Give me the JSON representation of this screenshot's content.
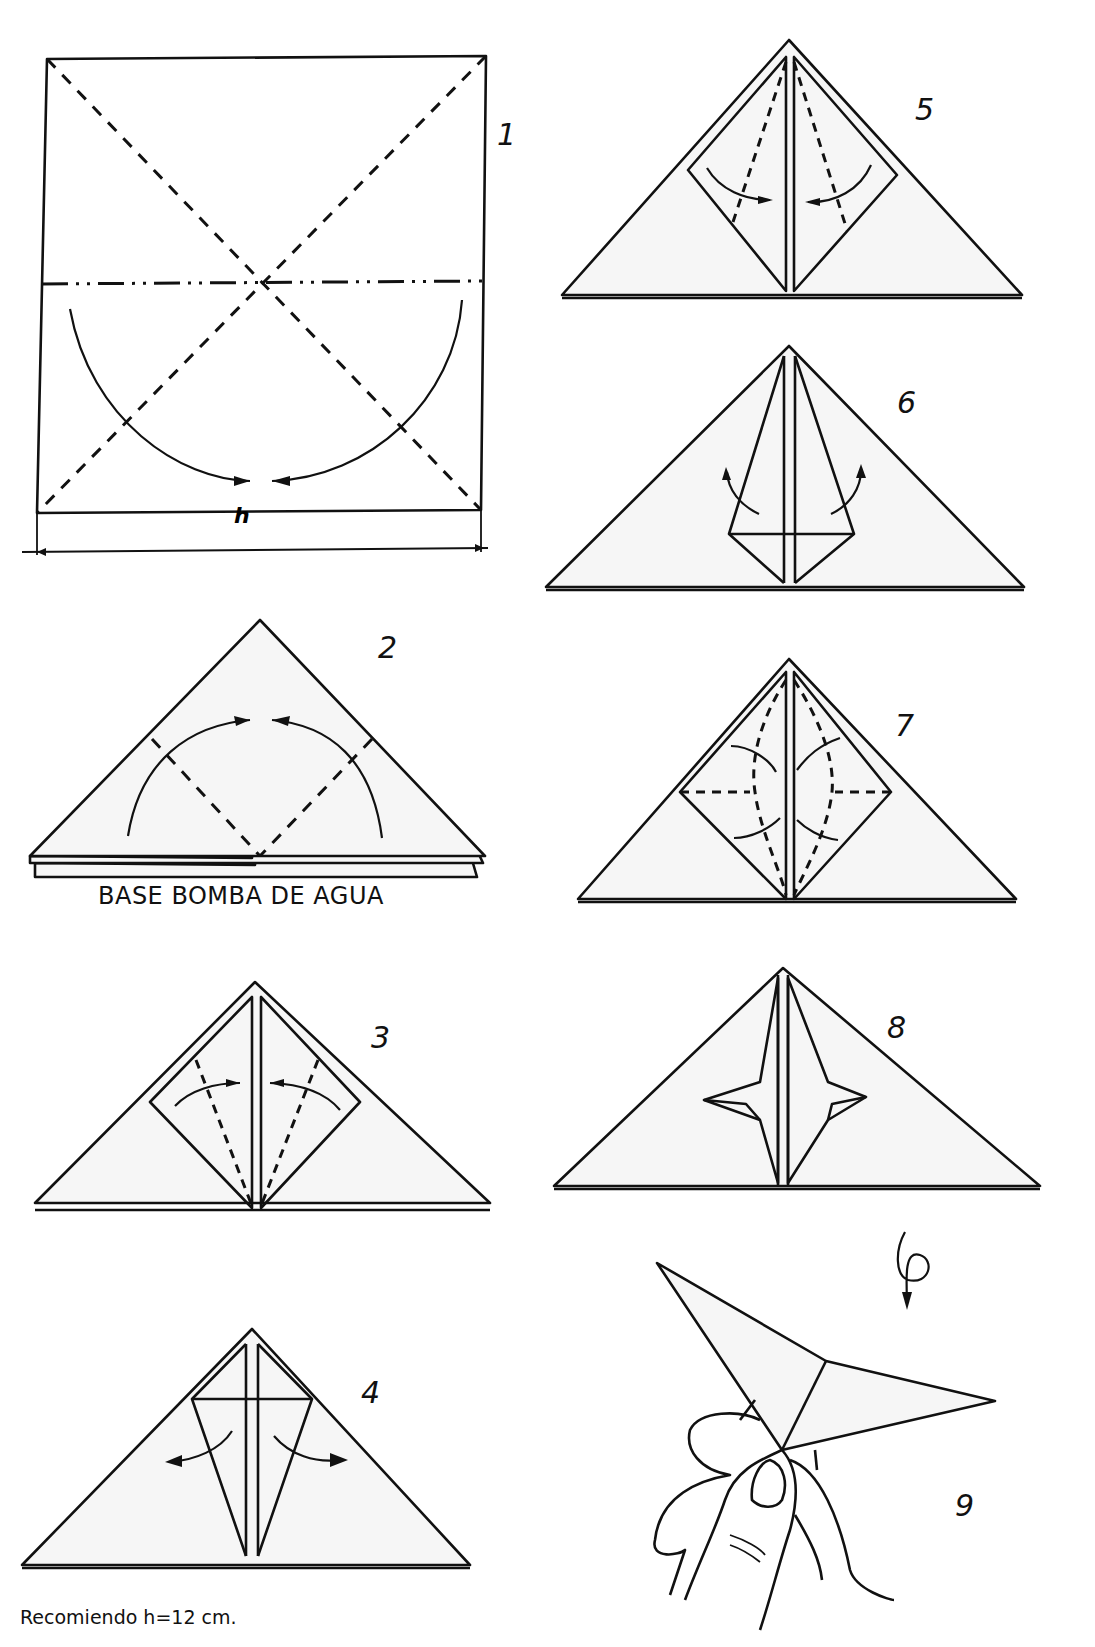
{
  "document": {
    "type": "origami-instructions",
    "base_name": "BASE BOMBA DE AGUA",
    "recommendation": "Recomiendo h=12 cm.",
    "dimension_label": "h"
  },
  "steps": [
    {
      "number": "1",
      "description": "Square with dashed diagonals, mountain-fold horizontal line, curved arrows folding lower half"
    },
    {
      "number": "2",
      "description": "Water bomb base triangle, fold side flaps up along dashed lines"
    },
    {
      "number": "3",
      "description": "Diamond; fold edges to center along dashed lines"
    },
    {
      "number": "4",
      "description": "Unfold flaps outward"
    },
    {
      "number": "5",
      "description": "Diamond; fold lower edges to center"
    },
    {
      "number": "6",
      "description": "Kite shape; open flaps"
    },
    {
      "number": "7",
      "description": "Squash / rabbit-ear folds on both sides"
    },
    {
      "number": "8",
      "description": "Result with side points"
    },
    {
      "number": "9",
      "description": "Turn over; hold finished model between fingers"
    }
  ],
  "symbols": {
    "valley_fold": "dashed-line",
    "mountain_fold": "dash-dot-dot-line",
    "turn_over": "loop-arrow-icon"
  },
  "colors": {
    "ink": "#111111",
    "paper": "#f6f6f6",
    "background": "#ffffff"
  }
}
